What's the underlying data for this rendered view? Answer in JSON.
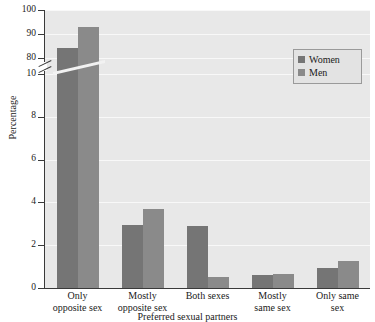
{
  "chart_data": {
    "type": "bar",
    "title": "",
    "subtitle": "",
    "xlabel": "Preferred sexual partners",
    "ylabel": "Percentage",
    "categories": [
      "Only\nopposite sex",
      "Mostly\nopposite sex",
      "Both sexes",
      "Mostly\nsame sex",
      "Only same\nsex"
    ],
    "series": [
      {
        "name": "Women",
        "color": "#757575",
        "values": [
          84.0,
          10.4,
          2.9,
          0.6,
          0.95
        ]
      },
      {
        "name": "Men",
        "color": "#8a8a8a",
        "values": [
          93.0,
          3.7,
          0.5,
          0.65,
          1.25
        ]
      }
    ],
    "ylim": [
      0,
      100
    ],
    "axis_break": {
      "present": true,
      "lower_max": 10,
      "upper_min": 80
    },
    "yticks": [
      0,
      2,
      4,
      6,
      8,
      10,
      80,
      90,
      100
    ],
    "ytick_labels": [
      "0",
      "2",
      "4",
      "6",
      "8",
      "10",
      "80",
      "90",
      "100"
    ],
    "grid": true,
    "legend_position": "top-right",
    "plot_background": "#e8e8e8",
    "gridline_color": "#f8f8f8"
  },
  "axis": {
    "y_title": "Percentage",
    "x_title": "Preferred sexual partners",
    "ticks": [
      {
        "label": "100"
      },
      {
        "label": "90"
      },
      {
        "label": "80"
      },
      {
        "label": "10"
      },
      {
        "label": "8"
      },
      {
        "label": "6"
      },
      {
        "label": "4"
      },
      {
        "label": "2"
      },
      {
        "label": "0"
      }
    ]
  },
  "categories": [
    {
      "line1": "Only",
      "line2": "opposite sex"
    },
    {
      "line1": "Mostly",
      "line2": "opposite sex"
    },
    {
      "line1": "Both sexes",
      "line2": ""
    },
    {
      "line1": "Mostly",
      "line2": "same sex"
    },
    {
      "line1": "Only same",
      "line2": "sex"
    }
  ],
  "legend": {
    "items": [
      {
        "label": "Women",
        "color": "#757575"
      },
      {
        "label": "Men",
        "color": "#8a8a8a"
      }
    ]
  }
}
